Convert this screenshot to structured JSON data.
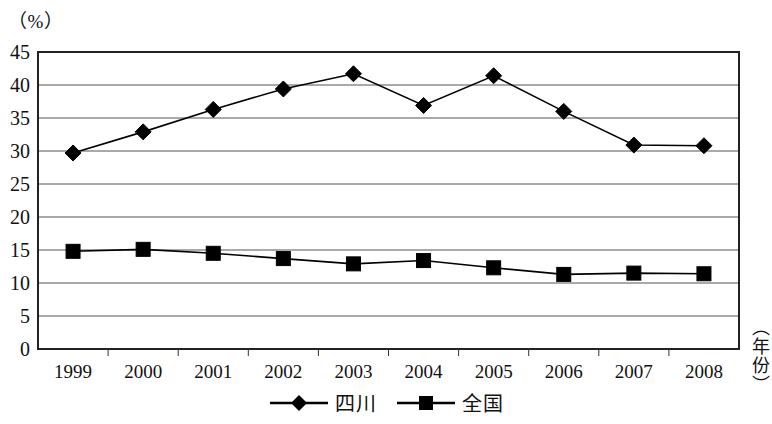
{
  "chart_data": {
    "type": "line",
    "title": "",
    "unit_label": "（%）",
    "xlabel": "（年份）",
    "ylabel": "",
    "categories": [
      "1999",
      "2000",
      "2001",
      "2002",
      "2003",
      "2004",
      "2005",
      "2006",
      "2007",
      "2008"
    ],
    "series": [
      {
        "name": "四川",
        "marker": "diamond",
        "color": "#000000",
        "values": [
          29.7,
          32.9,
          36.3,
          39.4,
          41.7,
          36.9,
          41.4,
          36.0,
          30.9,
          30.8
        ]
      },
      {
        "name": "全国",
        "marker": "square",
        "color": "#000000",
        "values": [
          14.8,
          15.1,
          14.5,
          13.7,
          12.9,
          13.4,
          12.3,
          11.3,
          11.5,
          11.4
        ]
      }
    ],
    "ylim": [
      0,
      45
    ],
    "yticks": [
      "0",
      "5",
      "10",
      "15",
      "20",
      "25",
      "30",
      "35",
      "40",
      "45"
    ],
    "grid": true,
    "grid_axis": "y",
    "legend_position": "bottom"
  },
  "legend": {
    "entries": [
      {
        "label": "四川",
        "marker": "diamond"
      },
      {
        "label": "全国",
        "marker": "square"
      }
    ]
  }
}
